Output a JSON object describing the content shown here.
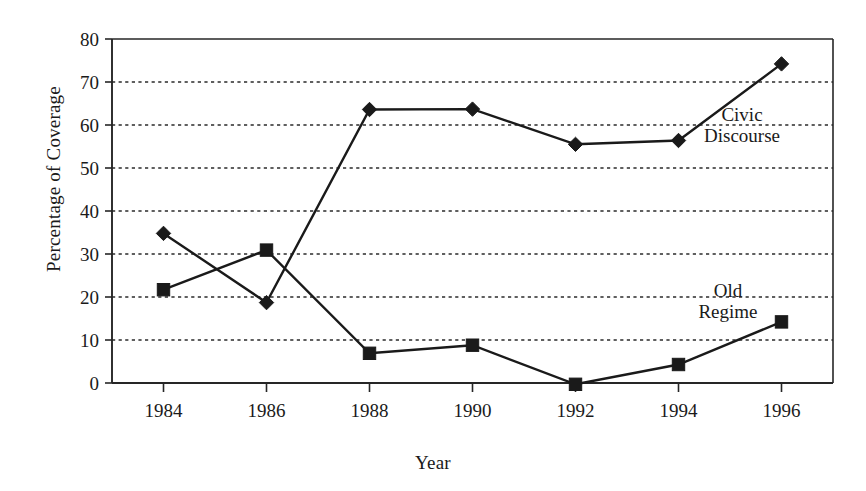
{
  "chart_data": {
    "type": "line",
    "title": "",
    "xlabel": "Year",
    "ylabel": "Percentage of Coverage",
    "categories": [
      1984,
      1986,
      1988,
      1990,
      1992,
      1994,
      1996
    ],
    "xtick_labels": [
      "1984",
      "1986",
      "1988",
      "1990",
      "1992",
      "1994",
      "1996"
    ],
    "ytick_labels": [
      "0",
      "10",
      "20",
      "30",
      "40",
      "50",
      "60",
      "70",
      "80"
    ],
    "ytick_values": [
      0,
      10,
      20,
      30,
      40,
      50,
      60,
      70,
      80
    ],
    "ylim": [
      0,
      80
    ],
    "xlim": [
      1983,
      1997
    ],
    "grid": "horizontal-dotted",
    "legend_position": "inline-annotations",
    "series": [
      {
        "name": "Civic Discourse",
        "marker": "diamond",
        "color": "#1a1a1a",
        "values": [
          34.8,
          18.7,
          63.6,
          63.7,
          55.5,
          56.4,
          74.2
        ]
      },
      {
        "name": "Old Regime",
        "marker": "square",
        "color": "#1a1a1a",
        "values": [
          21.7,
          30.9,
          6.9,
          8.8,
          -0.3,
          4.3,
          14.2
        ]
      }
    ],
    "annotations": [
      {
        "text_line1": "Civic",
        "text_line2": "Discourse",
        "series": "Civic Discourse"
      },
      {
        "text_line1": "Old",
        "text_line2": "Regime",
        "series": "Old Regime"
      }
    ]
  }
}
